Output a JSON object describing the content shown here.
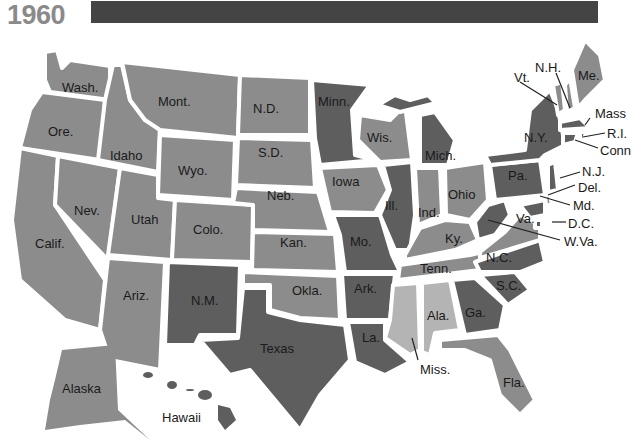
{
  "title": "1960",
  "colors": {
    "republican": "#8c8c8c",
    "democratic": "#5e5e5e",
    "unpledged": "#b4b4b4",
    "header_bar": "#444444",
    "year_text": "#8a8a8a"
  },
  "states": {
    "wa": "Wash.",
    "or": "Ore.",
    "ca": "Calif.",
    "id": "Idaho",
    "nv": "Nev.",
    "mt": "Mont.",
    "wy": "Wyo.",
    "ut": "Utah",
    "co": "Colo.",
    "az": "Ariz.",
    "nm": "N.M.",
    "nd": "N.D.",
    "sd": "S.D.",
    "ne": "Neb.",
    "ks": "Kan.",
    "ok": "Okla.",
    "tx": "Texas",
    "mn": "Minn.",
    "ia": "Iowa",
    "mo": "Mo.",
    "ar": "Ark.",
    "la": "La.",
    "wi": "Wis.",
    "il": "Ill.",
    "mi": "Mich.",
    "in": "Ind.",
    "oh": "Ohio",
    "ky": "Ky.",
    "tn": "Tenn.",
    "ms": "Miss.",
    "al": "Ala.",
    "ga": "Ga.",
    "fl": "Fla.",
    "sc": "S.C.",
    "nc": "N.C.",
    "va": "Va.",
    "wv": "W.Va.",
    "pa": "Pa.",
    "ny": "N.Y.",
    "vt": "Vt.",
    "nh": "N.H.",
    "me": "Me.",
    "ma": "Mass",
    "ri": "R.I.",
    "ct": "Conn",
    "nj": "N.J.",
    "de": "Del.",
    "md": "Md.",
    "dc": "D.C.",
    "ak": "Alaska",
    "hi": "Hawaii"
  }
}
